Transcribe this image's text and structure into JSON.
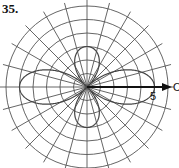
{
  "problem": {
    "number": "35."
  },
  "plot": {
    "type": "polar",
    "center": [
      87,
      87
    ],
    "unit_px": 13.5,
    "rings": 6,
    "radial_step_deg": 15,
    "axis_tick_label": "5",
    "axis_end_label": "O",
    "grid_color": "#555555",
    "curve_color": "#444444",
    "axis_color": "#111111"
  },
  "chart_data": {
    "type": "polar",
    "title": "35.",
    "rings_r": [
      1,
      2,
      3,
      4,
      5,
      6
    ],
    "radial_lines_deg_step": 15,
    "polar_axis_label": "5",
    "petals": [
      {
        "direction_deg": 0,
        "length": 5
      },
      {
        "direction_deg": 90,
        "length": 3
      },
      {
        "direction_deg": 180,
        "length": 5
      },
      {
        "direction_deg": 270,
        "length": 3
      }
    ]
  }
}
